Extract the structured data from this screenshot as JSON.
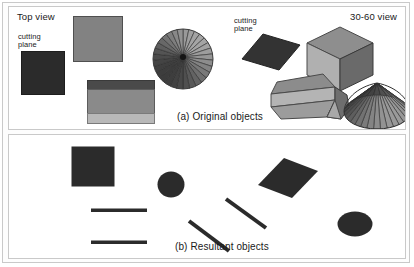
{
  "figure": {
    "panels": [
      {
        "id": "original-objects",
        "caption": "(a) Original objects",
        "view_left_label": "Top view",
        "view_right_label": "30-60 view",
        "cutting_plane_label_line1": "cutting",
        "cutting_plane_label_line2": "plane",
        "objects": [
          {
            "name": "cutting-plane-square",
            "view": "top",
            "fill": "#2b2b2b"
          },
          {
            "name": "cube-top-view-square",
            "view": "top",
            "fill": "#828282"
          },
          {
            "name": "prism-top-view-banded-rectangle",
            "view": "top",
            "bands": [
              "#4a4a4a",
              "#8a8a8a",
              "#b8b8b8"
            ]
          },
          {
            "name": "cone-top-view-radial-disk",
            "view": "top",
            "fill_dark": "#3c3c3c",
            "fill_light": "#a5a5a5"
          },
          {
            "name": "cutting-plane-parallelogram",
            "view": "30-60",
            "fill": "#333333"
          },
          {
            "name": "cube-isometric",
            "view": "30-60",
            "top_fill": "#8e8e8e",
            "left_fill": "#b0b0b0",
            "right_fill": "#6a6a6a"
          },
          {
            "name": "hexagonal-prism",
            "view": "30-60",
            "top_fill": "#8c8c8c",
            "side_fill": "#b4b4b4",
            "end_fill": "#6e6e6e"
          },
          {
            "name": "cone-3d",
            "view": "30-60",
            "fill_dark": "#3a3a3a",
            "fill_light": "#9a9a9a"
          }
        ]
      },
      {
        "id": "resultant-objects",
        "caption": "(b) Resultant objects",
        "objects": [
          {
            "name": "result-square",
            "view": "top",
            "fill": "#2b2b2b"
          },
          {
            "name": "result-circle",
            "view": "top",
            "fill": "#2b2b2b"
          },
          {
            "name": "result-line-upper",
            "view": "top",
            "fill": "#2b2b2b"
          },
          {
            "name": "result-line-lower",
            "view": "top",
            "fill": "#2b2b2b"
          },
          {
            "name": "result-parallelogram",
            "view": "30-60",
            "fill": "#2b2b2b"
          },
          {
            "name": "result-diagonal-line-upper",
            "view": "30-60",
            "fill": "#2b2b2b"
          },
          {
            "name": "result-diagonal-line-lower",
            "view": "30-60",
            "fill": "#2b2b2b"
          },
          {
            "name": "result-ellipse",
            "view": "30-60",
            "fill": "#2b2b2b"
          }
        ]
      }
    ]
  },
  "colors": {
    "ink": "#1a1a1a",
    "frame": "#c9c9c9",
    "dark_shape": "#2b2b2b",
    "mid_gray": "#8a8a8a",
    "light_gray": "#b8b8b8"
  }
}
